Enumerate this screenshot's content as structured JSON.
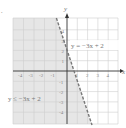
{
  "figure_marker": ".",
  "axes": {
    "x_label": "x",
    "y_label": "y",
    "x_ticks": [
      "-4",
      "-3",
      "-2",
      "-1",
      "1",
      "2",
      "3",
      "4"
    ],
    "y_ticks": [
      "4",
      "3",
      "2",
      "1",
      "-1",
      "-2",
      "-3",
      "-4"
    ]
  },
  "boundary": {
    "label": "y = −3x + 2",
    "style": "dashed",
    "slope": -3,
    "intercept": 2
  },
  "inequality": {
    "label": "y ≤ −3x + 2",
    "shaded_side": "left"
  },
  "colors": {
    "shade": "#e6e6e6",
    "grid": "#cfcfcf",
    "axis": "#333333",
    "boundary": "#777777",
    "text": "#777777"
  }
}
